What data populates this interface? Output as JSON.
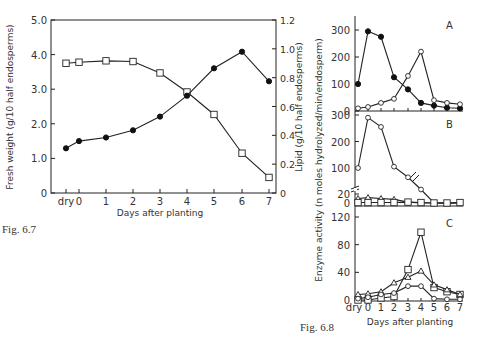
{
  "chart_data": [
    {
      "id": "fig-6-7",
      "type": "line",
      "caption": "Fig. 6.7",
      "title": "",
      "xlabel": "Days after planting",
      "ylabel": "Fresh weight (g/10 half endosperms)",
      "ylabel_right": "Lipid (g/10 half endosperms)",
      "categories": [
        "dry",
        "0",
        "1",
        "2",
        "3",
        "4",
        "5",
        "6",
        "7"
      ],
      "ylim": [
        0,
        5.0
      ],
      "yticks": [
        "0",
        "1.0",
        "2.0",
        "3.0",
        "4.0",
        "5.0"
      ],
      "ylim_right": [
        0,
        1.2
      ],
      "yticks_right": [
        "0",
        "0.2",
        "0.4",
        "0.6",
        "0.8",
        "1.0",
        "1.2"
      ],
      "grid": false,
      "series": [
        {
          "name": "Fresh weight",
          "marker": "open-square",
          "axis": "left",
          "values": [
            3.75,
            3.78,
            3.82,
            3.8,
            3.47,
            2.92,
            2.27,
            1.15,
            0.45
          ]
        },
        {
          "name": "Lipid",
          "marker": "filled-circle",
          "axis": "right",
          "values": [
            0.31,
            0.36,
            0.385,
            0.435,
            0.53,
            0.675,
            0.865,
            0.98,
            0.775
          ]
        }
      ]
    },
    {
      "id": "fig-6-8",
      "type": "line",
      "caption": "Fig. 6.8",
      "xlabel": "Days after planting",
      "ylabel": "Enzyme activity (n moles hydrolyzed/min/endosperm)",
      "categories": [
        "dry",
        "0",
        "1",
        "2",
        "3",
        "4",
        "5",
        "6",
        "7"
      ],
      "panels": [
        {
          "label": "A",
          "ylim": [
            0,
            350
          ],
          "yticks": [
            "0",
            "100",
            "200",
            "300"
          ],
          "series": [
            {
              "name": "filled-circle series",
              "marker": "filled-circle",
              "values": [
                100,
                295,
                275,
                125,
                80,
                30,
                20,
                12,
                10
              ]
            },
            {
              "name": "open-circle series",
              "marker": "open-circle",
              "values": [
                10,
                15,
                30,
                45,
                130,
                220,
                40,
                30,
                25
              ]
            }
          ]
        },
        {
          "label": "B",
          "ylim": [
            0,
            300
          ],
          "yticks": [
            "0",
            "20",
            "100",
            "200",
            "300"
          ],
          "broken_axis": true,
          "series": [
            {
              "name": "open-circle series",
              "marker": "open-circle",
              "values": [
                100,
                290,
                255,
                105,
                65,
                30,
                0,
                0,
                0
              ]
            },
            {
              "name": "triangle series",
              "marker": "open-triangle",
              "values": [
                10,
                12,
                10,
                8,
                2,
                0,
                0,
                0,
                0
              ]
            },
            {
              "name": "square series",
              "marker": "open-square",
              "values": [
                1,
                1,
                1,
                1,
                2,
                1,
                0,
                0,
                1
              ]
            }
          ]
        },
        {
          "label": "C",
          "ylim": [
            0,
            130
          ],
          "yticks": [
            "0",
            "40",
            "80",
            "120"
          ],
          "series": [
            {
              "name": "open-square series",
              "marker": "open-square",
              "values": [
                0,
                0,
                3,
                5,
                44,
                98,
                18,
                12,
                8
              ]
            },
            {
              "name": "open-triangle series",
              "marker": "open-triangle",
              "values": [
                8,
                9,
                12,
                25,
                33,
                42,
                22,
                15,
                8
              ]
            },
            {
              "name": "open-circle series",
              "marker": "open-circle",
              "values": [
                2,
                4,
                8,
                10,
                20,
                20,
                2,
                1,
                1
              ]
            }
          ]
        }
      ]
    }
  ],
  "labels": {
    "fig67_caption": "Fig. 6.7",
    "fig68_caption": "Fig. 6.8",
    "fig67_xlabel": "Days after planting",
    "fig68_xlabel": "Days after planting",
    "fig67_ylabel_left": "Fresh weight (g/10 half endosperms)",
    "fig67_ylabel_right": "Lipid (g/10 half endosperms)",
    "fig68_ylabel": "Enzyme activity (n moles hydrolyzed/min/endosperm)",
    "panel_a": "A",
    "panel_b": "B",
    "panel_c": "C"
  }
}
